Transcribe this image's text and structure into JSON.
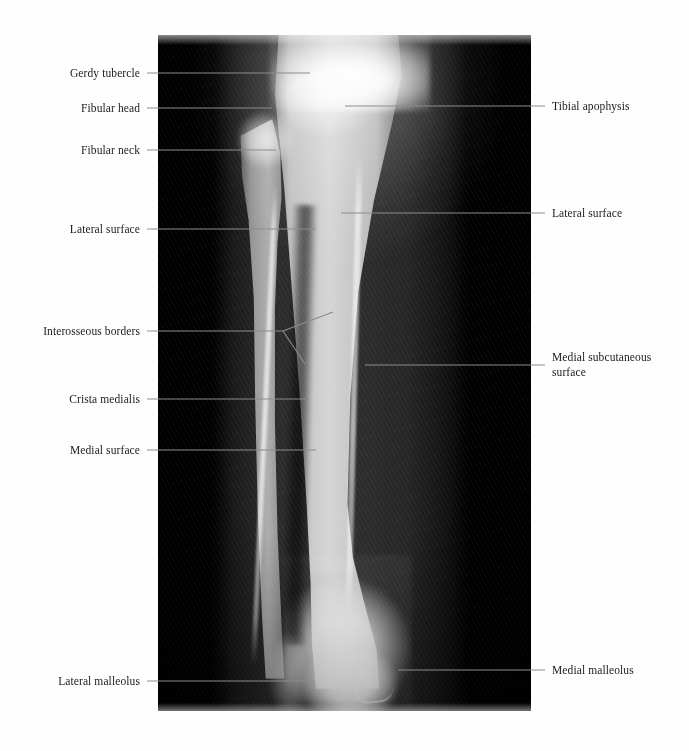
{
  "figure": {
    "kind": "annotated-radiograph",
    "background_color": "#ffffff",
    "panel": {
      "name": "radiograph",
      "x": 158,
      "y": 35,
      "width": 373,
      "height": 676,
      "background_color": "#000000",
      "bones": [
        "tibia",
        "fibula"
      ]
    },
    "leader_color": "#8c8c8c",
    "text_color": "#1b1b1b"
  },
  "labels": {
    "left": [
      {
        "id": "gerdy-tubercle",
        "text": "Gerdy tubercle",
        "text_x": 140,
        "y": 73,
        "line_from_x": 147,
        "line_to_x": 310
      },
      {
        "id": "fibular-head",
        "text": "Fibular head",
        "text_x": 140,
        "y": 108,
        "line_from_x": 147,
        "line_to_x": 272
      },
      {
        "id": "fibular-neck",
        "text": "Fibular neck",
        "text_x": 140,
        "y": 150,
        "line_from_x": 147,
        "line_to_x": 276
      },
      {
        "id": "lateral-surface-left",
        "text": "Lateral surface",
        "text_x": 140,
        "y": 229,
        "line_from_x": 147,
        "line_to_x": 316
      },
      {
        "id": "interosseous-borders",
        "text": "Interosseous borders",
        "text_x": 140,
        "y": 331,
        "line_from_x": 147,
        "line_to_x": 283
      },
      {
        "id": "crista-medialis",
        "text": "Crista medialis",
        "text_x": 140,
        "y": 399,
        "line_from_x": 147,
        "line_to_x": 309
      },
      {
        "id": "medial-surface",
        "text": "Medial surface",
        "text_x": 140,
        "y": 450,
        "line_from_x": 147,
        "line_to_x": 316
      },
      {
        "id": "lateral-malleolus",
        "text": "Lateral malleolus",
        "text_x": 140,
        "y": 681,
        "line_from_x": 147,
        "line_to_x": 306
      }
    ],
    "right": [
      {
        "id": "tibial-apophysis",
        "text": "Tibial apophysis",
        "text_x": 552,
        "y": 106,
        "line_from_x": 345,
        "line_to_x": 545
      },
      {
        "id": "lateral-surface-right",
        "text": "Lateral surface",
        "text_x": 552,
        "y": 213,
        "line_from_x": 341,
        "line_to_x": 545
      },
      {
        "id": "medial-subcutaneous-surface",
        "text": "Medial subcutaneous\nsurface",
        "text_x": 552,
        "y": 365,
        "line_from_x": 365,
        "line_to_x": 545
      },
      {
        "id": "medial-malleolus",
        "text": "Medial malleolus",
        "text_x": 552,
        "y": 670,
        "line_from_x": 398,
        "line_to_x": 545
      }
    ],
    "forked": {
      "id": "interosseous-borders-fork",
      "note": "Leader for Interosseous borders splits into two branches",
      "hub_x": 283,
      "hub_y": 331,
      "branch_upper_x": 333,
      "branch_upper_y": 312,
      "branch_lower_x": 305,
      "branch_lower_y": 364
    }
  }
}
